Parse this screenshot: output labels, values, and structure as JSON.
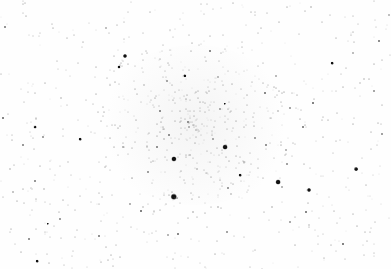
{
  "image": {
    "description": "Inverted (negative) astronomical star field: dark stars on white background with a faint open cluster concentration near center",
    "background": "#fefefe",
    "star_color": "#111111"
  },
  "bright_stars": [
    {
      "x": 174,
      "y": 197,
      "r": 3.2
    },
    {
      "x": 174,
      "y": 159,
      "r": 2.6
    },
    {
      "x": 225,
      "y": 147,
      "r": 2.4
    },
    {
      "x": 278,
      "y": 182,
      "r": 2.4
    },
    {
      "x": 309,
      "y": 190,
      "r": 2.0
    },
    {
      "x": 356,
      "y": 169,
      "r": 1.9
    },
    {
      "x": 125,
      "y": 56,
      "r": 2.0
    },
    {
      "x": 185,
      "y": 76,
      "r": 1.7
    },
    {
      "x": 119,
      "y": 67,
      "r": 1.5
    },
    {
      "x": 35,
      "y": 127,
      "r": 1.4
    },
    {
      "x": 80,
      "y": 139,
      "r": 1.3
    },
    {
      "x": 225,
      "y": 104,
      "r": 1.2
    },
    {
      "x": 332,
      "y": 63,
      "r": 1.3
    },
    {
      "x": 240,
      "y": 175,
      "r": 1.3
    },
    {
      "x": 48,
      "y": 224,
      "r": 1.2
    },
    {
      "x": 37,
      "y": 261,
      "r": 1.3
    }
  ]
}
